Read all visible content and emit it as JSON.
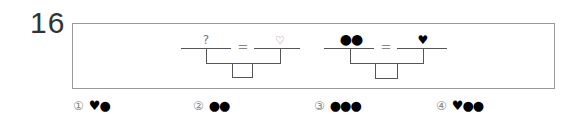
{
  "question": {
    "number": "16"
  },
  "diagram": {
    "left": {
      "top_left": "?",
      "equals": "=",
      "top_right": "♡"
    },
    "right": {
      "top_left": "●●",
      "equals": "=",
      "top_right": "♥"
    }
  },
  "choices": [
    {
      "num": "①",
      "value": "♥●"
    },
    {
      "num": "②",
      "value": "●●"
    },
    {
      "num": "③",
      "value": "●●●"
    },
    {
      "num": "④",
      "value": "♥●●"
    }
  ]
}
